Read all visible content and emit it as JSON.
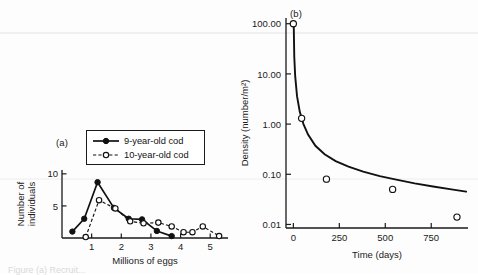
{
  "figure": {
    "panel_a_label": "(a)",
    "panel_b_label": "(b)",
    "caption_fragment": "Figure  (a) Recruit..."
  },
  "chart_data": [
    {
      "type": "line",
      "panel": "(a)",
      "title": "",
      "xlabel": "Millions of eggs",
      "ylabel": "Number of individuals",
      "xlim": [
        0,
        5.6
      ],
      "ylim": [
        0,
        10.6
      ],
      "xticks": [
        1,
        2,
        3,
        4,
        5
      ],
      "xticklabels": [
        "1",
        "2",
        "3",
        "4",
        "5"
      ],
      "yticks": [
        5,
        10
      ],
      "yticklabels": [
        "5",
        "10"
      ],
      "grid": false,
      "legend_position": "top-right",
      "series": [
        {
          "name": "9-year-old cod",
          "marker": "filled-circle",
          "line": "solid",
          "x": [
            0.35,
            0.75,
            1.2,
            1.75,
            2.25,
            2.7,
            3.2,
            3.7
          ],
          "y": [
            1.0,
            3.0,
            8.7,
            4.7,
            3.0,
            2.9,
            1.1,
            0.3
          ]
        },
        {
          "name": "10-year-old cod",
          "marker": "open-circle",
          "line": "dashed",
          "x": [
            0.8,
            1.25,
            1.8,
            2.3,
            2.75,
            3.25,
            3.7,
            4.1,
            4.4,
            4.75,
            5.3
          ],
          "y": [
            0.15,
            5.9,
            4.6,
            2.6,
            2.3,
            2.4,
            1.8,
            0.9,
            0.9,
            1.8,
            0.3
          ]
        }
      ]
    },
    {
      "type": "scatter",
      "panel": "(b)",
      "title": "",
      "xlabel": "Time (days)",
      "ylabel": "Density (number/m²)",
      "xlim": [
        -40,
        950
      ],
      "ylim": [
        0.0085,
        130
      ],
      "yscale": "log",
      "xticks": [
        0,
        250,
        500,
        750
      ],
      "xticklabels": [
        "0",
        "250",
        "500",
        "750"
      ],
      "yticks": [
        0.01,
        0.1,
        1,
        10,
        100
      ],
      "yticklabels": [
        "0.01",
        "0.10",
        "1.00",
        "10.00",
        "100.00"
      ],
      "grid": false,
      "points": [
        {
          "x": 0,
          "y": 100.0
        },
        {
          "x": 45,
          "y": 1.3
        },
        {
          "x": 180,
          "y": 0.08
        },
        {
          "x": 540,
          "y": 0.05
        },
        {
          "x": 890,
          "y": 0.014
        }
      ],
      "fit_curve": {
        "name": "self-thinning fit",
        "x": [
          2,
          5,
          10,
          20,
          35,
          55,
          80,
          120,
          170,
          230,
          300,
          380,
          470,
          560,
          660,
          760,
          860,
          940
        ],
        "y": [
          100.0,
          22.0,
          9.0,
          3.6,
          1.75,
          1.0,
          0.62,
          0.37,
          0.25,
          0.183,
          0.142,
          0.113,
          0.092,
          0.078,
          0.066,
          0.057,
          0.05,
          0.045
        ]
      }
    }
  ]
}
